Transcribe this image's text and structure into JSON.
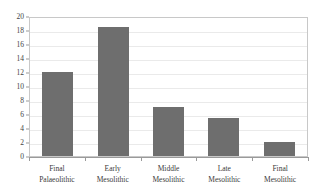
{
  "chart_data": {
    "type": "bar",
    "title": "",
    "subtitle": "",
    "xlabel": "",
    "ylabel": "",
    "categories": [
      "Final Palaeolithic",
      "Early Mesolithic",
      "Middle Mesolithic",
      "Late Mesolithic",
      "Final Mesolithic"
    ],
    "category_lines": [
      [
        "Final",
        "Palaeolithic"
      ],
      [
        "Early",
        "Mesolithic"
      ],
      [
        "Middle",
        "Mesolithic"
      ],
      [
        "Late",
        "Mesolithic"
      ],
      [
        "Final",
        "Mesolithic"
      ]
    ],
    "values": [
      12,
      18.5,
      7,
      5.5,
      2
    ],
    "ylim": [
      0,
      20
    ],
    "ytick_step": 2,
    "yticks": [
      20,
      18,
      16,
      14,
      12,
      10,
      8,
      6,
      4,
      2,
      0
    ],
    "ytick_labels": [
      "20",
      "18",
      "16",
      "14",
      "12",
      "10",
      "8",
      "6",
      "4",
      "2",
      "0"
    ],
    "grid": true,
    "grid_axis": "y",
    "legend": null,
    "legend_position": "none",
    "annotations": []
  },
  "style": {
    "bar_color": "#6e6e6e",
    "grid_color": "#eaeaea",
    "axis_color": "#9a9a9a",
    "frame_color": "#c8c8c8",
    "background": "#ffffff",
    "tick_label_color": "#444444"
  }
}
